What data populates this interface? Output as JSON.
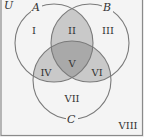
{
  "diagram": {
    "type": "venn",
    "universe_label": "U",
    "sets": [
      {
        "id": "A",
        "label": "A",
        "cx": 54,
        "cy": 43,
        "r": 39
      },
      {
        "id": "B",
        "label": "B",
        "cx": 90,
        "cy": 43,
        "r": 39
      },
      {
        "id": "C",
        "label": "C",
        "cx": 72,
        "cy": 80,
        "r": 39
      }
    ],
    "regions": [
      {
        "id": "I",
        "label": "I",
        "description": "A only",
        "shaded": false
      },
      {
        "id": "II",
        "label": "II",
        "description": "A and B only",
        "shaded": true
      },
      {
        "id": "III",
        "label": "III",
        "description": "B only",
        "shaded": false
      },
      {
        "id": "IV",
        "label": "IV",
        "description": "A and C only",
        "shaded": true
      },
      {
        "id": "V",
        "label": "V",
        "description": "A and B and C",
        "shaded": true
      },
      {
        "id": "VI",
        "label": "VI",
        "description": "B and C only",
        "shaded": true
      },
      {
        "id": "VII",
        "label": "VII",
        "description": "C only",
        "shaded": false
      },
      {
        "id": "VIII",
        "label": "VIII",
        "description": "outside A, B, C",
        "shaded": false
      }
    ],
    "colors": {
      "background": "#f4f4f4",
      "stroke": "#7a7a7a",
      "frame": "#8a8a8a",
      "pairwise_fill": "#c9c9c9",
      "triple_fill": "#a9a9a9",
      "text": "#333333"
    }
  }
}
